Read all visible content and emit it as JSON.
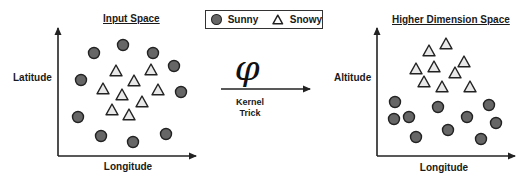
{
  "left_panel": {
    "title": "Input Space",
    "x_label": "Longitude",
    "y_label": "Latitude",
    "sunny_points": [
      [
        94,
        53
      ],
      [
        123,
        45
      ],
      [
        153,
        53
      ],
      [
        174,
        66
      ],
      [
        81,
        80
      ],
      [
        181,
        92
      ],
      [
        78,
        117
      ],
      [
        101,
        136
      ],
      [
        133,
        142
      ],
      [
        166,
        134
      ]
    ],
    "snowy_points": [
      [
        116,
        71
      ],
      [
        151,
        70
      ],
      [
        134,
        81
      ],
      [
        103,
        89
      ],
      [
        158,
        90
      ],
      [
        122,
        95
      ],
      [
        142,
        102
      ],
      [
        112,
        110
      ],
      [
        129,
        115
      ]
    ]
  },
  "right_panel": {
    "title": "Higher Dimension Space",
    "x_label": "Longitude",
    "y_label": "Altitude",
    "snowy_points": [
      [
        446,
        44
      ],
      [
        429,
        51
      ],
      [
        464,
        62
      ],
      [
        434,
        67
      ],
      [
        416,
        69
      ],
      [
        455,
        73
      ],
      [
        424,
        82
      ],
      [
        442,
        87
      ],
      [
        470,
        87
      ]
    ],
    "sunny_points": [
      [
        395,
        102
      ],
      [
        438,
        107
      ],
      [
        489,
        105
      ],
      [
        394,
        119
      ],
      [
        409,
        117
      ],
      [
        467,
        117
      ],
      [
        496,
        123
      ],
      [
        448,
        130
      ],
      [
        416,
        137
      ],
      [
        481,
        139
      ]
    ]
  },
  "legend": {
    "items": [
      {
        "label": "Sunny",
        "shape": "circle-icon"
      },
      {
        "label": "Snowy",
        "shape": "triangle-icon"
      }
    ]
  },
  "transform": {
    "symbol": "φ",
    "label_line1": "Kernel",
    "label_line2": "Trick"
  },
  "colors": {
    "circle_fill": "#666666",
    "triangle_fill": "#e8e8e8",
    "stroke": "#222222"
  }
}
